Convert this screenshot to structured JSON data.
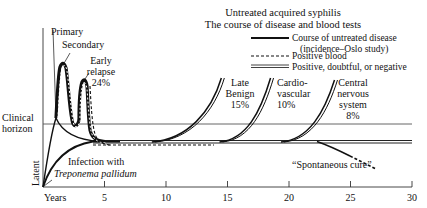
{
  "title": {
    "line1": "Untreated acquired syphilis",
    "line2": "The course of disease and blood tests"
  },
  "legend": {
    "position": "top-right",
    "items": [
      {
        "style": "solid-thick",
        "line1": "Course of untreated disease",
        "line2": "(incidence–Oslo study)"
      },
      {
        "style": "dashed",
        "line1": "Positive blood"
      },
      {
        "style": "double-thin",
        "line1": "Positive, doubtful, or negative"
      }
    ]
  },
  "axis": {
    "x_label": "Years",
    "x_ticks": [
      "5",
      "10",
      "15",
      "20",
      "25",
      "30"
    ],
    "x_tick_values": [
      5,
      10,
      15,
      20,
      25,
      30
    ],
    "x_range": [
      0,
      30
    ],
    "y_labels": {
      "clinical_horizon_line1": "Clinical",
      "clinical_horizon_line2": "horizon",
      "latent": "Latent"
    }
  },
  "stages": {
    "primary": "Primary",
    "secondary": "Secondary",
    "early_relapse_line1": "Early",
    "early_relapse_line2": "relapse",
    "early_relapse_pct": "24%",
    "late_benign_line1": "Late",
    "late_benign_line2": "Benign",
    "late_benign_pct": "15%",
    "cardio_line1": "Cardio-",
    "cardio_line2": "vascular",
    "cardio_pct": "10%",
    "cns_line1": "Central",
    "cns_line2": "nervous",
    "cns_line3": "system",
    "cns_pct": "8%"
  },
  "annotations": {
    "infection_line1": "Infection with",
    "infection_line2": "Treponema pallidum",
    "spontaneous_cure": "“Spontaneous cure”"
  },
  "branch_start_years": {
    "late_benign": 9.5,
    "cardiovascular": 15,
    "central_nervous_system": 20,
    "spontaneous_cure": 22
  }
}
